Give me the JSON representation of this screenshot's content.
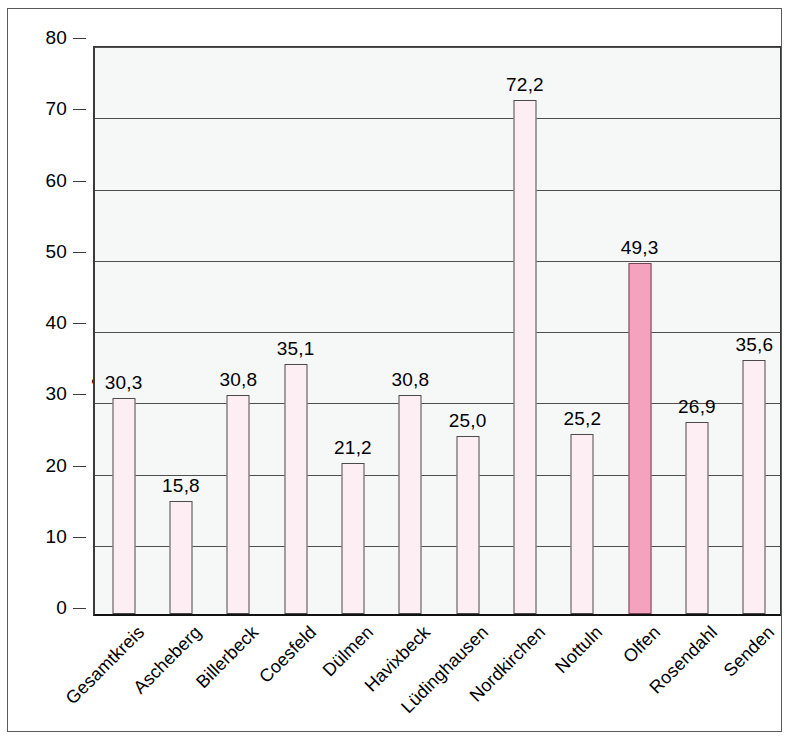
{
  "chart_data": {
    "type": "bar",
    "title": "",
    "xlabel": "",
    "ylabel": "m² pro Einwohner",
    "ylabel_html": "m<sup>2</sup> pro Einwohner",
    "ylim": [
      0,
      80
    ],
    "yticks": [
      0,
      10,
      20,
      30,
      40,
      50,
      60,
      70,
      80
    ],
    "ytick_labels": [
      "0",
      "10",
      "20",
      "30",
      "40",
      "50",
      "60",
      "70",
      "80"
    ],
    "grid": true,
    "legend": "none",
    "decimal_separator": ",",
    "categories": [
      "Gesamtkreis",
      "Ascheberg",
      "Billerbeck",
      "Coesfeld",
      "Dülmen",
      "Havixbeck",
      "Lüdinghausen",
      "Nordkirchen",
      "Nottuln",
      "Olfen",
      "Rosendahl",
      "Senden"
    ],
    "values": [
      30.3,
      15.8,
      30.8,
      35.1,
      21.2,
      30.8,
      25.0,
      72.2,
      25.2,
      49.3,
      26.9,
      35.6
    ],
    "value_labels": [
      "30,3",
      "15,8",
      "30,8",
      "35,1",
      "21,2",
      "30,8",
      "25,0",
      "72,2",
      "25,2",
      "49,3",
      "26,9",
      "35,6"
    ],
    "highlight_index": 9,
    "highlight_category": "Olfen",
    "colors": {
      "bar_fill": "#fdeef3",
      "bar_highlight_fill": "#f4a2bd",
      "bar_edge": "#4a4a4a",
      "plot_background": "#f6f7f7",
      "gridline": "#4e4e4e",
      "axis": "#3a3a3a",
      "frame": "#5a5a5a",
      "text": "#000000"
    }
  }
}
